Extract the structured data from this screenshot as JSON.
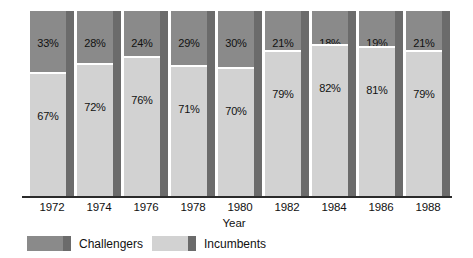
{
  "chart_data": {
    "type": "bar",
    "subtype": "100% stacked column",
    "title": "",
    "xlabel": "Year",
    "ylabel": "",
    "ylim": [
      0,
      100
    ],
    "grid": false,
    "legend_position": "bottom-left",
    "categories": [
      "1972",
      "1974",
      "1976",
      "1978",
      "1980",
      "1982",
      "1984",
      "1986",
      "1988"
    ],
    "series": [
      {
        "name": "Challengers",
        "color": "#8a8a8a",
        "values": [
          33,
          28,
          24,
          29,
          30,
          21,
          18,
          19,
          21
        ],
        "value_labels": [
          "33%",
          "28%",
          "24%",
          "29%",
          "30%",
          "21%",
          "18%",
          "19%",
          "21%"
        ]
      },
      {
        "name": "Incumbents",
        "color": "#d2d2d2",
        "values": [
          67,
          72,
          76,
          71,
          70,
          79,
          82,
          81,
          79
        ],
        "value_labels": [
          "67%",
          "72%",
          "76%",
          "71%",
          "70%",
          "79%",
          "82%",
          "81%",
          "79%"
        ]
      }
    ],
    "stack_order": [
      "Incumbents",
      "Challengers"
    ],
    "annotations": []
  },
  "axis": {
    "title": "Year",
    "tick_labels": [
      "1972",
      "1974",
      "1976",
      "1978",
      "1980",
      "1982",
      "1984",
      "1986",
      "1988"
    ]
  },
  "legend": {
    "items": [
      {
        "label": "Challengers",
        "color": "#8a8a8a"
      },
      {
        "label": "Incumbents",
        "color": "#d2d2d2"
      }
    ]
  },
  "colors": {
    "challengers": "#8a8a8a",
    "incumbents": "#d2d2d2",
    "bar_side_shadow": "#6b6b6b",
    "axis_line": "#2b2b2b",
    "background": "#ffffff",
    "text": "#111111"
  }
}
